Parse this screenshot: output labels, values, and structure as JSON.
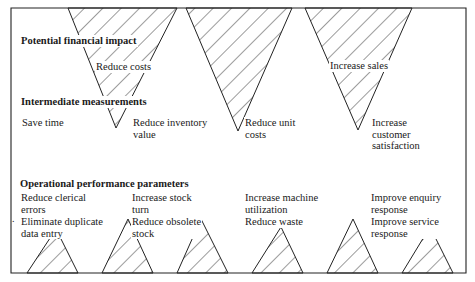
{
  "diagram": {
    "sections": {
      "financial": "Potential financial impact",
      "intermediate": "Intermediate measurements",
      "operational": "Operational performance parameters"
    },
    "financial_impacts": [
      {
        "label": "Reduce costs"
      },
      {
        "label": "Increase sales"
      }
    ],
    "intermediate_measures": [
      {
        "label": "Save time"
      },
      {
        "label": "Reduce inventory\nvalue"
      },
      {
        "label": "Reduce unit\ncosts"
      },
      {
        "label": "Increase\ncustomer\nsatisfaction"
      }
    ],
    "operational_parameters": [
      {
        "label": "Reduce clerical\nerrors"
      },
      {
        "label": "Eliminate duplicate\ndata entry"
      },
      {
        "label": "Increase stock\nturn"
      },
      {
        "label": "Reduce obsolete\nstock"
      },
      {
        "label": "Increase machine\nutilization"
      },
      {
        "label": "Reduce waste"
      },
      {
        "label": "Improve enquiry\nresponse"
      },
      {
        "label": "Improve service\nresponse"
      }
    ],
    "stray_mark": "."
  }
}
